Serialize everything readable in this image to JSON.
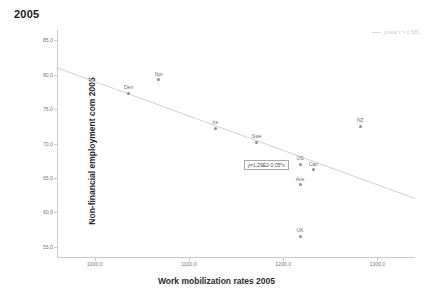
{
  "chart_data": {
    "type": "scatter",
    "title": "2005",
    "xlabel": "Work mobilization rates 2005",
    "ylabel": "Non-financial employment com 2005",
    "xlim": [
      960,
      1340
    ],
    "ylim": [
      53.5,
      86.5
    ],
    "xticks": [
      1000.0,
      1100.0,
      1200.0,
      1300.0
    ],
    "xticklabels": [
      "1000,0",
      "1100,0",
      "1200,0",
      "1300,0"
    ],
    "yticks": [
      55.0,
      60.0,
      65.0,
      70.0,
      75.0,
      80.0,
      85.0
    ],
    "yticklabels": [
      "55,0",
      "60,0",
      "65,0",
      "70,0",
      "75,0",
      "80,0",
      "85,0"
    ],
    "grid": false,
    "points": [
      {
        "label": "Den",
        "x": 1036,
        "y": 77.3
      },
      {
        "label": "Nor",
        "x": 1068,
        "y": 79.3
      },
      {
        "label": "Ire",
        "x": 1128,
        "y": 72.2
      },
      {
        "label": "Swe",
        "x": 1172,
        "y": 70.2
      },
      {
        "label": "US",
        "x": 1218,
        "y": 67.0
      },
      {
        "label": "Can",
        "x": 1232,
        "y": 66.2
      },
      {
        "label": "Aus",
        "x": 1218,
        "y": 64.0
      },
      {
        "label": "UK",
        "x": 1218,
        "y": 56.5
      },
      {
        "label": "NZ",
        "x": 1282,
        "y": 72.5
      }
    ],
    "fit": {
      "equation": "y=1,29E2-0,05*x",
      "intercept": 129.0,
      "slope": -0.05,
      "x_start": 960,
      "x_end": 1340
    },
    "legend": {
      "position": "top-right",
      "entries": [
        {
          "label": "Linear r = 0,585"
        }
      ]
    },
    "colors": {
      "point": "#8d8d8d",
      "line": "#d0d0d0",
      "axis": "#c9c9c9",
      "text": "#555555"
    }
  }
}
